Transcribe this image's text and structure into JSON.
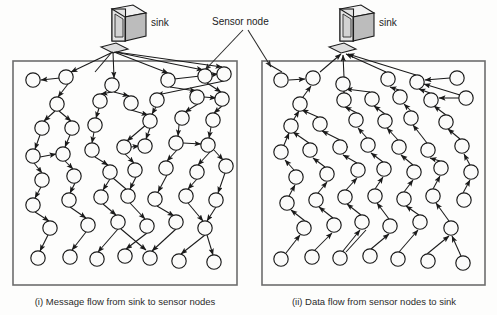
{
  "figure": {
    "title_present": false,
    "labels": {
      "sink_left": "sink",
      "sink_right": "sink",
      "sensor_node": "Sensor node"
    },
    "captions": {
      "left": "(i) Message flow from sink to sensor nodes",
      "right": "(ii) Data flow from  sensor nodes to sink"
    },
    "colors": {
      "node_stroke": "#1a1a1a",
      "node_fill": "#fbfbfa",
      "edge": "#1a1a1a",
      "panel_border": "#6d6d6d",
      "text": "#2b2b2b",
      "background": "#fdfdfc"
    },
    "panels": [
      {
        "id": "left-panel",
        "name": "message-flow-panel",
        "direction": "sink-to-nodes",
        "rect": {
          "x": 13,
          "y": 61,
          "w": 224,
          "h": 224
        },
        "sink": {
          "x": 128,
          "y": 22,
          "base_x": 115,
          "base_y": 49
        },
        "node_count": 47
      },
      {
        "id": "right-panel",
        "name": "data-flow-panel",
        "direction": "nodes-to-sink",
        "rect": {
          "x": 262,
          "y": 61,
          "w": 223,
          "h": 224
        },
        "sink": {
          "x": 355,
          "y": 22,
          "base_x": 343,
          "base_y": 49
        },
        "node_count": 47
      }
    ],
    "legend_leaders": [
      {
        "from": [
          243,
          29
        ],
        "to": [
          204,
          74
        ],
        "name": "sensor-node-leader-left"
      },
      {
        "from": [
          248,
          29
        ],
        "to": [
          271,
          70
        ],
        "name": "sensor-node-leader-right"
      }
    ],
    "left_nodes": [
      [
        33,
        80
      ],
      [
        66,
        77
      ],
      [
        112,
        85
      ],
      [
        168,
        80
      ],
      [
        205,
        76
      ],
      [
        224,
        74
      ],
      [
        57,
        104
      ],
      [
        100,
        101
      ],
      [
        131,
        103
      ],
      [
        157,
        100
      ],
      [
        197,
        97
      ],
      [
        222,
        99
      ],
      [
        42,
        128
      ],
      [
        72,
        128
      ],
      [
        95,
        125
      ],
      [
        150,
        121
      ],
      [
        182,
        118
      ],
      [
        213,
        120
      ],
      [
        33,
        156
      ],
      [
        63,
        154
      ],
      [
        92,
        150
      ],
      [
        124,
        147
      ],
      [
        145,
        146
      ],
      [
        176,
        143
      ],
      [
        208,
        145
      ],
      [
        42,
        180
      ],
      [
        74,
        176
      ],
      [
        110,
        172
      ],
      [
        135,
        170
      ],
      [
        166,
        168
      ],
      [
        197,
        172
      ],
      [
        226,
        166
      ],
      [
        33,
        205
      ],
      [
        69,
        200
      ],
      [
        101,
        197
      ],
      [
        128,
        196
      ],
      [
        155,
        199
      ],
      [
        186,
        196
      ],
      [
        216,
        200
      ],
      [
        50,
        228
      ],
      [
        88,
        225
      ],
      [
        118,
        222
      ],
      [
        147,
        226
      ],
      [
        176,
        222
      ],
      [
        205,
        228
      ],
      [
        38,
        258
      ],
      [
        70,
        257
      ],
      [
        97,
        259
      ],
      [
        125,
        256
      ],
      [
        150,
        258
      ],
      [
        179,
        261
      ],
      [
        214,
        262
      ]
    ],
    "right_nodes": [
      [
        281,
        80
      ],
      [
        313,
        78
      ],
      [
        343,
        84
      ],
      [
        388,
        79
      ],
      [
        417,
        82
      ],
      [
        457,
        78
      ],
      [
        300,
        104
      ],
      [
        344,
        100
      ],
      [
        372,
        99
      ],
      [
        400,
        97
      ],
      [
        431,
        100
      ],
      [
        466,
        98
      ],
      [
        291,
        126
      ],
      [
        320,
        124
      ],
      [
        356,
        120
      ],
      [
        385,
        121
      ],
      [
        411,
        118
      ],
      [
        446,
        122
      ],
      [
        281,
        152
      ],
      [
        310,
        150
      ],
      [
        340,
        147
      ],
      [
        368,
        145
      ],
      [
        399,
        147
      ],
      [
        428,
        150
      ],
      [
        462,
        146
      ],
      [
        296,
        177
      ],
      [
        327,
        174
      ],
      [
        358,
        170
      ],
      [
        384,
        169
      ],
      [
        414,
        172
      ],
      [
        441,
        168
      ],
      [
        471,
        172
      ],
      [
        287,
        203
      ],
      [
        316,
        200
      ],
      [
        345,
        197
      ],
      [
        375,
        196
      ],
      [
        404,
        199
      ],
      [
        433,
        196
      ],
      [
        464,
        200
      ],
      [
        304,
        228
      ],
      [
        334,
        225
      ],
      [
        362,
        222
      ],
      [
        390,
        226
      ],
      [
        420,
        222
      ],
      [
        451,
        228
      ],
      [
        281,
        259
      ],
      [
        312,
        257
      ],
      [
        340,
        258
      ],
      [
        370,
        256
      ],
      [
        398,
        259
      ],
      [
        428,
        261
      ],
      [
        463,
        263
      ]
    ]
  }
}
